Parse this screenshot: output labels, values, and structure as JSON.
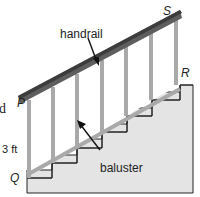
{
  "diagram": {
    "type": "staircase-geometry",
    "labels": {
      "handrail": "handrail",
      "baluster": "baluster",
      "height": "3 ft",
      "point_s": "S",
      "point_r": "R",
      "point_p": "P",
      "point_q": "Q",
      "cut_text": "d"
    },
    "colors": {
      "handrail": "#5e5e5e",
      "handrail_edge": "#3c3c3c",
      "baluster": "#a9a9a9",
      "stair_fill": "#e4e4e4",
      "outline": "#222222",
      "step_face": "#ffffff"
    },
    "baluster_count": 7,
    "step_count": 5
  }
}
